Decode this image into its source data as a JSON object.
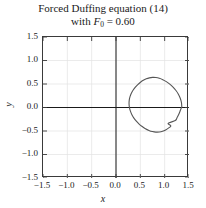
{
  "title": {
    "line1": "Forced Duffing equation (14)",
    "line2_prefix": "with ",
    "line2_var": "F",
    "line2_sub": "0",
    "line2_rest": " = 0.60"
  },
  "axis_titles": {
    "x": "x",
    "y": "y"
  },
  "colors": {
    "curve": "#555555",
    "frame": "#3a3a3a",
    "axis": "#1a1a1a",
    "grid": "#e2e2e2",
    "background": "#ffffff",
    "text": "#1a1a1a"
  },
  "chart_data": {
    "type": "line",
    "subtitle": "with F_0 = 0.60",
    "xlabel": "x",
    "ylabel": "y",
    "xlim": [
      -1.5,
      1.5
    ],
    "ylim": [
      -1.5,
      1.5
    ],
    "xticks": [
      -1.5,
      -1.0,
      -0.5,
      0.0,
      0.5,
      1.0,
      1.5
    ],
    "yticks": [
      -1.5,
      -1.0,
      -0.5,
      0.0,
      0.5,
      1.0,
      1.5
    ],
    "xtick_labels": [
      "−1.5",
      "−1.0",
      "−0.5",
      "0.0",
      "0.5",
      "1.0",
      "1.5"
    ],
    "ytick_labels": [
      "−1.5",
      "−1.0",
      "−0.5",
      "0.0",
      "0.5",
      "1.0",
      "1.5"
    ],
    "grid": true,
    "legend": null,
    "axes_through_origin": true,
    "series": [
      {
        "name": "limit cycle orbit",
        "closed": true,
        "x": [
          1.352,
          1.344,
          1.32,
          1.282,
          1.232,
          1.172,
          1.105,
          1.034,
          0.962,
          0.89,
          0.82,
          0.752,
          0.686,
          0.622,
          0.561,
          0.503,
          0.448,
          0.398,
          0.353,
          0.315,
          0.288,
          0.272,
          0.268,
          0.276,
          0.296,
          0.327,
          0.368,
          0.418,
          0.475,
          0.538,
          0.605,
          0.676,
          0.748,
          0.82,
          0.89,
          0.957,
          1.019,
          1.076,
          1.127,
          1.072,
          1.218,
          1.256,
          1.288,
          1.314,
          1.334,
          1.347,
          1.352
        ],
        "y": [
          0.02,
          0.11,
          0.198,
          0.283,
          0.362,
          0.434,
          0.497,
          0.55,
          0.592,
          0.621,
          0.637,
          0.64,
          0.631,
          0.61,
          0.579,
          0.538,
          0.489,
          0.433,
          0.371,
          0.303,
          0.231,
          0.156,
          0.078,
          0.0,
          -0.078,
          -0.153,
          -0.225,
          -0.291,
          -0.352,
          -0.405,
          -0.451,
          -0.487,
          -0.512,
          -0.524,
          -0.522,
          -0.506,
          -0.478,
          -0.44,
          -0.392,
          -0.337,
          -0.277,
          -0.213,
          -0.148,
          -0.084,
          -0.029,
          0.0,
          0.02
        ]
      }
    ]
  }
}
